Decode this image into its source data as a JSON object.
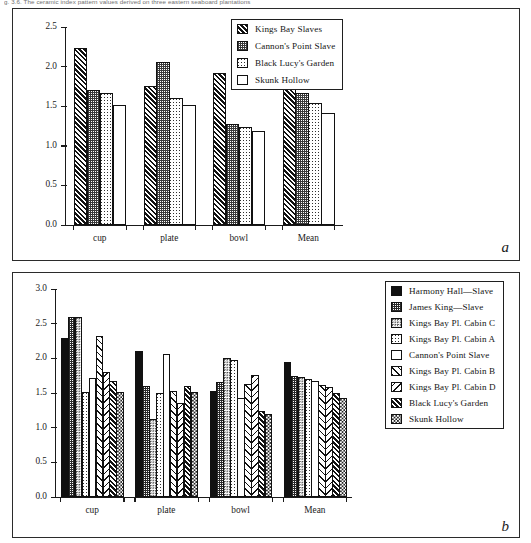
{
  "caption_top": "g. 3.6. The ceramic index pattern values derived on three eastern seaboard plantations",
  "panels": {
    "a": {
      "letter": "a"
    },
    "b": {
      "letter": "b"
    }
  },
  "chart_data": [
    {
      "id": "chart-a",
      "type": "bar",
      "title": "",
      "xlabel": "",
      "ylabel": "",
      "ylim": [
        0.0,
        2.5
      ],
      "yticks": [
        "0.0",
        "0.5",
        "1.0",
        "1.5",
        "2.0",
        "2.5"
      ],
      "grid": false,
      "legend_position": "top-right",
      "categories": [
        "cup",
        "plate",
        "bowl",
        "Mean"
      ],
      "series": [
        {
          "name": "Kings Bay Slaves",
          "fill": "p-hatch-dense",
          "values": [
            2.23,
            1.76,
            1.92,
            1.86
          ]
        },
        {
          "name": "Cannon's Point Slave",
          "fill": "p-stipple-med",
          "values": [
            1.7,
            2.06,
            1.27,
            1.67
          ]
        },
        {
          "name": "Black Lucy's Garden",
          "fill": "p-stipple-light",
          "values": [
            1.67,
            1.6,
            1.24,
            1.54
          ]
        },
        {
          "name": "Skunk Hollow",
          "fill": "p-white",
          "values": [
            1.52,
            1.51,
            1.19,
            1.41
          ]
        }
      ]
    },
    {
      "id": "chart-b",
      "type": "bar",
      "title": "",
      "xlabel": "",
      "ylabel": "",
      "ylim": [
        0.0,
        3.0
      ],
      "yticks": [
        "0.0",
        "0.5",
        "1.0",
        "1.5",
        "2.0",
        "2.5",
        "3.0"
      ],
      "grid": false,
      "legend_position": "top-right",
      "categories": [
        "cup",
        "plate",
        "bowl",
        "Mean"
      ],
      "series": [
        {
          "name": "Harmony Hall—Slave",
          "fill": "p-solid",
          "values": [
            2.29,
            2.1,
            1.53,
            1.94
          ]
        },
        {
          "name": "James King—Slave",
          "fill": "p-checker-dark",
          "values": [
            2.59,
            1.6,
            1.66,
            1.75
          ]
        },
        {
          "name": "Kings Bay Pl. Cabin C",
          "fill": "p-stipple-mid",
          "values": [
            2.59,
            1.12,
            2.0,
            1.73
          ]
        },
        {
          "name": "Kings Bay Pl. Cabin A",
          "fill": "p-stipple-light",
          "values": [
            1.52,
            1.5,
            1.98,
            1.7
          ]
        },
        {
          "name": "Cannon's Point Slave",
          "fill": "p-white",
          "values": [
            1.71,
            2.06,
            1.43,
            1.67
          ]
        },
        {
          "name": "Kings Bay Pl. Cabin B",
          "fill": "p-hatch-open",
          "values": [
            2.32,
            1.53,
            1.63,
            1.62
          ]
        },
        {
          "name": "Kings Bay Pl. Cabin D",
          "fill": "p-hatch-back",
          "values": [
            1.8,
            1.36,
            1.76,
            1.58
          ]
        },
        {
          "name": "Black Lucy's Garden",
          "fill": "p-hatch-dense",
          "values": [
            1.67,
            1.6,
            1.24,
            1.5
          ]
        },
        {
          "name": "Skunk Hollow",
          "fill": "p-dots",
          "values": [
            1.52,
            1.51,
            1.19,
            1.43
          ]
        }
      ]
    }
  ]
}
